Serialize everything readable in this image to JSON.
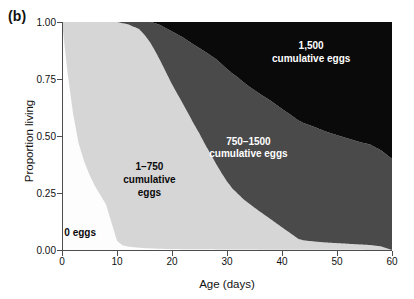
{
  "panel": {
    "label": "(b)"
  },
  "chart_data": {
    "type": "area",
    "title": "",
    "subtitle": "",
    "xlabel": "Age (days)",
    "ylabel": "Proportion living",
    "xlim": [
      0,
      60
    ],
    "ylim": [
      0,
      1
    ],
    "grid": false,
    "legend_position": "inline-annotations",
    "xticks": [
      "0",
      "10",
      "20",
      "30",
      "40",
      "50",
      "60"
    ],
    "xtick_values": [
      0,
      10,
      20,
      30,
      40,
      50,
      60
    ],
    "yticks": [
      "0.00",
      "0.25",
      "0.50",
      "0.75",
      "1.00"
    ],
    "ytick_values": [
      0.0,
      0.25,
      0.5,
      0.75,
      1.0
    ],
    "stacking": "from-bottom",
    "series": [
      {
        "name": "0 eggs",
        "color": "#fdfdfd",
        "label": "0 eggs",
        "label_color": "#0a0a0a",
        "x": [
          0,
          1,
          2,
          3,
          4,
          5,
          6,
          7,
          8,
          9,
          10,
          11,
          12,
          13,
          14,
          15,
          16,
          18,
          20,
          25,
          30,
          40,
          50,
          60
        ],
        "values": [
          1.0,
          0.78,
          0.6,
          0.47,
          0.39,
          0.33,
          0.28,
          0.24,
          0.2,
          0.12,
          0.04,
          0.02,
          0.015,
          0.012,
          0.01,
          0.008,
          0.007,
          0.005,
          0.004,
          0.003,
          0.002,
          0.001,
          0.001,
          0.0
        ]
      },
      {
        "name": "1-750 cumulative eggs",
        "color": "#d6d6d6",
        "label": "1–750\ncumulative\neggs",
        "label_color": "#0a0a0a",
        "x": [
          0,
          1,
          2,
          3,
          4,
          5,
          6,
          7,
          8,
          9,
          10,
          11,
          12,
          13,
          14,
          15,
          16,
          17,
          18,
          19,
          20,
          21,
          22,
          23,
          24,
          25,
          26,
          27,
          28,
          29,
          30,
          31,
          32,
          33,
          34,
          35,
          36,
          37,
          38,
          39,
          40,
          41,
          42,
          43,
          44,
          45,
          46,
          48,
          50,
          52,
          54,
          56,
          58,
          60
        ],
        "values": [
          0.0,
          0.22,
          0.4,
          0.53,
          0.61,
          0.67,
          0.72,
          0.76,
          0.8,
          0.88,
          0.955,
          0.96,
          0.955,
          0.95,
          0.94,
          0.91,
          0.87,
          0.83,
          0.79,
          0.745,
          0.7,
          0.655,
          0.61,
          0.565,
          0.52,
          0.475,
          0.425,
          0.38,
          0.335,
          0.295,
          0.26,
          0.23,
          0.21,
          0.19,
          0.175,
          0.16,
          0.145,
          0.13,
          0.115,
          0.1,
          0.085,
          0.07,
          0.055,
          0.04,
          0.035,
          0.033,
          0.031,
          0.028,
          0.026,
          0.024,
          0.022,
          0.02,
          0.015,
          0.0
        ]
      },
      {
        "name": "750-1500 cumulative eggs",
        "color": "#4a4a4a",
        "label": "750–1500\ncumulative eggs",
        "label_color": "#ffffff",
        "x": [
          0,
          5,
          10,
          12,
          14,
          15,
          16,
          17,
          18,
          19,
          20,
          22,
          24,
          26,
          28,
          30,
          32,
          34,
          36,
          38,
          40,
          42,
          44,
          46,
          48,
          50,
          52,
          54,
          56,
          58,
          60
        ],
        "values": [
          0.0,
          0.0,
          0.0,
          0.01,
          0.03,
          0.055,
          0.085,
          0.12,
          0.155,
          0.19,
          0.225,
          0.28,
          0.33,
          0.375,
          0.41,
          0.43,
          0.44,
          0.445,
          0.45,
          0.45,
          0.45,
          0.445,
          0.44,
          0.435,
          0.43,
          0.425,
          0.42,
          0.415,
          0.41,
          0.405,
          0.4
        ]
      },
      {
        "name": "1,500 cumulative eggs",
        "color": "#0a0a0a",
        "label": "1,500\ncumulative eggs",
        "label_color": "#ffffff",
        "x": [
          0,
          10,
          14,
          16,
          17,
          18,
          20,
          22,
          24,
          26,
          28,
          30,
          32,
          34,
          36,
          38,
          40,
          42,
          44,
          46,
          48,
          50,
          52,
          54,
          56,
          58,
          60
        ],
        "values": [
          0.0,
          0.0,
          0.0,
          0.0,
          0.005,
          0.015,
          0.04,
          0.065,
          0.095,
          0.12,
          0.145,
          0.18,
          0.21,
          0.245,
          0.275,
          0.3,
          0.33,
          0.355,
          0.38,
          0.4,
          0.425,
          0.445,
          0.465,
          0.485,
          0.5,
          0.54,
          0.6
        ]
      }
    ],
    "annotations": [
      {
        "name": "zero-eggs-label",
        "text": "0 eggs",
        "x_frac": 0.055,
        "y_frac": 0.925,
        "color": "#0a0a0a"
      },
      {
        "name": "low-eggs-label",
        "text": "1–750\ncumulative\neggs",
        "x_frac": 0.265,
        "y_frac": 0.695,
        "color": "#0a0a0a"
      },
      {
        "name": "mid-eggs-label",
        "text": "750–1500\ncumulative eggs",
        "x_frac": 0.565,
        "y_frac": 0.555,
        "color": "#ffffff"
      },
      {
        "name": "high-eggs-label",
        "text": "1,500\ncumulative eggs",
        "x_frac": 0.755,
        "y_frac": 0.135,
        "color": "#ffffff"
      }
    ]
  },
  "colors": {
    "zero_eggs": "#fdfdfd",
    "low_eggs": "#d6d6d6",
    "mid_eggs": "#4a4a4a",
    "high_eggs": "#0a0a0a",
    "axis": "#4d4d4d",
    "text": "#111111"
  }
}
